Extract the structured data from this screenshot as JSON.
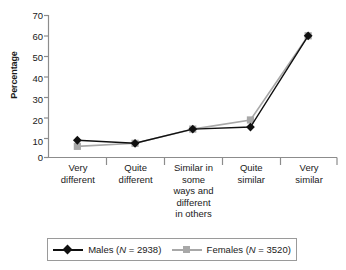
{
  "chart_data": {
    "type": "line",
    "title": "",
    "xlabel": "",
    "ylabel": "Percentage",
    "ylim": [
      0,
      70
    ],
    "yticks": [
      0,
      10,
      20,
      30,
      40,
      50,
      60,
      70
    ],
    "grid": false,
    "legend_position": "bottom",
    "categories": [
      "Very different",
      "Quite different",
      "Similar in some ways and different in others",
      "Quite similar",
      "Very similar"
    ],
    "series": [
      {
        "name": "Males (N = 2938)",
        "values": [
          8.5,
          7,
          14,
          15,
          60
        ],
        "color": "#101010",
        "marker": "diamond"
      },
      {
        "name": "Females (N = 3520)",
        "values": [
          5.5,
          7,
          14,
          18.5,
          60
        ],
        "color": "#a8a8a8",
        "marker": "square"
      }
    ]
  },
  "axis": {
    "y_label": "Percentage",
    "y_ticks": [
      "70",
      "60",
      "50",
      "40",
      "30",
      "20",
      "10",
      "0"
    ],
    "x_tick_lines": [
      [
        "Very",
        "different"
      ],
      [
        "Quite",
        "different"
      ],
      [
        "Similar in",
        "some",
        "ways and",
        "different",
        "in others"
      ],
      [
        "Quite",
        "similar"
      ],
      [
        "Very",
        "similar"
      ]
    ]
  },
  "legend": {
    "entries": [
      {
        "label_pre": "Males (",
        "label_italic": "N",
        "label_post": " = 2938)",
        "marker": "diamond-marker",
        "color": "#101010"
      },
      {
        "label_pre": "Females (",
        "label_italic": "N",
        "label_post": " = 3520)",
        "marker": "square-marker",
        "color": "#a8a8a8"
      }
    ]
  },
  "colors": {
    "males": "#101010",
    "females": "#a8a8a8",
    "axis": "#8c8c8c",
    "text": "#1a1a1a"
  }
}
